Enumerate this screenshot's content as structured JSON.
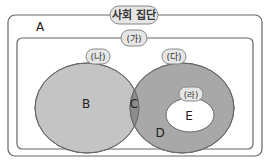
{
  "diagram": {
    "outer_label": "사회 집단",
    "outer_region": "A",
    "inner_label": "(가)",
    "circle_left_label": "(나)",
    "circle_right_label": "(다)",
    "inner_small_label": "(라)",
    "regions": {
      "left_only": "B",
      "intersection": "C",
      "right_only": "D",
      "inner_small": "E"
    },
    "colors": {
      "frame_stroke": "#666666",
      "left_circle_fill": "#c4c4c4",
      "right_circle_fill": "#a8a8a8",
      "intersection_fill": "#8c8c8c",
      "small_fill": "#ffffff",
      "tag_fill": "#e6e6e6"
    }
  }
}
